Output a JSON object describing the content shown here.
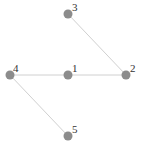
{
  "graph": {
    "node_color": "#8c8c8c",
    "edge_color": "#d0d0d0",
    "nodes": [
      {
        "id": "1",
        "label": "1",
        "x": 68,
        "y": 75
      },
      {
        "id": "2",
        "label": "2",
        "x": 126,
        "y": 75
      },
      {
        "id": "3",
        "label": "3",
        "x": 68,
        "y": 14
      },
      {
        "id": "4",
        "label": "4",
        "x": 10,
        "y": 75
      },
      {
        "id": "5",
        "label": "5",
        "x": 68,
        "y": 136
      }
    ],
    "edges": [
      {
        "source": "3",
        "target": "2"
      },
      {
        "source": "4",
        "target": "1"
      },
      {
        "source": "1",
        "target": "2"
      },
      {
        "source": "4",
        "target": "5"
      }
    ]
  }
}
